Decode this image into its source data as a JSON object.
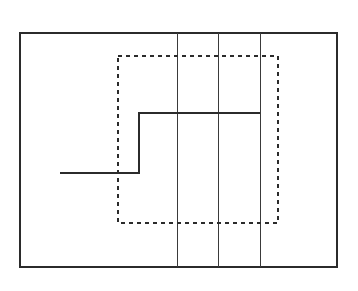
{
  "figure": {
    "panel_label": "B",
    "background_color": "#ffffff",
    "stroke_color": "#2b2b2b",
    "width": 358,
    "height": 291
  },
  "chart_data": {
    "type": "line",
    "title": "B",
    "xlabel": "",
    "ylabel": "",
    "xlim": [
      20,
      337
    ],
    "ylim": [
      33,
      267
    ],
    "grid": false,
    "legend_position": "none",
    "elements": [
      {
        "name": "outer-frame",
        "type": "rectangle",
        "style": "solid",
        "x": 20,
        "y": 33,
        "width": 317,
        "height": 234,
        "stroke_width": 2,
        "fill": "none"
      },
      {
        "name": "dashed-region",
        "type": "rectangle",
        "style": "dashed",
        "x": 118,
        "y": 56,
        "width": 160,
        "height": 167,
        "stroke_width": 2,
        "dash_pattern": "4 4",
        "fill": "none"
      },
      {
        "name": "vertical-divider-1",
        "type": "line",
        "style": "solid",
        "x": 177,
        "y1": 33,
        "y2": 267,
        "stroke_width": 1.3
      },
      {
        "name": "vertical-divider-2",
        "type": "line",
        "style": "solid",
        "x": 218,
        "y1": 33,
        "y2": 267,
        "stroke_width": 1.3
      },
      {
        "name": "vertical-divider-3",
        "type": "line",
        "style": "solid",
        "x": 260,
        "y1": 33,
        "y2": 267,
        "stroke_width": 1.3
      },
      {
        "name": "step-trace",
        "type": "polyline",
        "style": "solid",
        "stroke_width": 2,
        "points": "60,173 139,173 139,113 260,113"
      }
    ],
    "step_trace": {
      "x": [
        60,
        139,
        139,
        260
      ],
      "y": [
        173,
        173,
        113,
        113
      ],
      "low_level_y": 173,
      "high_level_y": 113,
      "transition_x": 139
    }
  }
}
